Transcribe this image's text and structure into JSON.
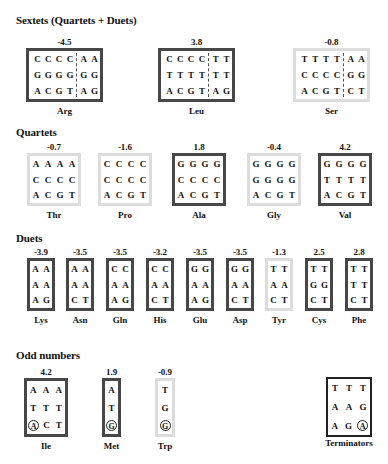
{
  "sections": {
    "sextets": {
      "title": "Sextets (Quartets + Duets)",
      "items": [
        {
          "name": "Arg",
          "value": "-4.5",
          "style": "dark",
          "rows": [
            [
              "C",
              "C",
              "C",
              "C",
              "A",
              "A"
            ],
            [
              "G",
              "G",
              "G",
              "G",
              "G",
              "G"
            ],
            [
              "A",
              "C",
              "G",
              "T",
              "A",
              "G"
            ]
          ]
        },
        {
          "name": "Leu",
          "value": "3.8",
          "style": "dark",
          "rows": [
            [
              "C",
              "C",
              "C",
              "C",
              "T",
              "T"
            ],
            [
              "T",
              "T",
              "T",
              "T",
              "T",
              "T"
            ],
            [
              "A",
              "C",
              "G",
              "T",
              "A",
              "G"
            ]
          ]
        },
        {
          "name": "Ser",
          "value": "-0.8",
          "style": "light",
          "rows": [
            [
              "T",
              "T",
              "T",
              "T",
              "A",
              "A"
            ],
            [
              "C",
              "C",
              "C",
              "C",
              "G",
              "G"
            ],
            [
              "A",
              "C",
              "G",
              "T",
              "C",
              "T"
            ]
          ]
        }
      ]
    },
    "quartets": {
      "title": "Quartets",
      "items": [
        {
          "name": "Thr",
          "value": "-0.7",
          "style": "light",
          "rows": [
            [
              "A",
              "A",
              "A",
              "A"
            ],
            [
              "C",
              "C",
              "C",
              "C"
            ],
            [
              "A",
              "C",
              "G",
              "T"
            ]
          ]
        },
        {
          "name": "Pro",
          "value": "-1.6",
          "style": "light",
          "rows": [
            [
              "C",
              "C",
              "C",
              "C"
            ],
            [
              "C",
              "C",
              "C",
              "C"
            ],
            [
              "A",
              "C",
              "G",
              "T"
            ]
          ]
        },
        {
          "name": "Ala",
          "value": "1.8",
          "style": "dark",
          "rows": [
            [
              "G",
              "G",
              "G",
              "G"
            ],
            [
              "C",
              "C",
              "C",
              "C"
            ],
            [
              "A",
              "C",
              "G",
              "T"
            ]
          ]
        },
        {
          "name": "Gly",
          "value": "-0.4",
          "style": "light",
          "rows": [
            [
              "G",
              "G",
              "G",
              "G"
            ],
            [
              "G",
              "G",
              "G",
              "G"
            ],
            [
              "A",
              "C",
              "G",
              "T"
            ]
          ]
        },
        {
          "name": "Val",
          "value": "4.2",
          "style": "dark",
          "rows": [
            [
              "G",
              "G",
              "G",
              "G"
            ],
            [
              "T",
              "T",
              "T",
              "T"
            ],
            [
              "A",
              "C",
              "G",
              "T"
            ]
          ]
        }
      ]
    },
    "duets": {
      "title": "Duets",
      "items": [
        {
          "name": "Lys",
          "value": "-3.9",
          "style": "dark",
          "rows": [
            [
              "A",
              "A"
            ],
            [
              "A",
              "A"
            ],
            [
              "A",
              "G"
            ]
          ]
        },
        {
          "name": "Asn",
          "value": "-3.5",
          "style": "dark",
          "rows": [
            [
              "A",
              "A"
            ],
            [
              "A",
              "A"
            ],
            [
              "C",
              "T"
            ]
          ]
        },
        {
          "name": "Gln",
          "value": "-3.5",
          "style": "dark",
          "rows": [
            [
              "C",
              "C"
            ],
            [
              "A",
              "A"
            ],
            [
              "A",
              "G"
            ]
          ]
        },
        {
          "name": "His",
          "value": "-3.2",
          "style": "dark",
          "rows": [
            [
              "C",
              "C"
            ],
            [
              "A",
              "A"
            ],
            [
              "C",
              "T"
            ]
          ]
        },
        {
          "name": "Glu",
          "value": "-3.5",
          "style": "dark",
          "rows": [
            [
              "G",
              "G"
            ],
            [
              "A",
              "A"
            ],
            [
              "A",
              "G"
            ]
          ]
        },
        {
          "name": "Asp",
          "value": "-3.5",
          "style": "dark",
          "rows": [
            [
              "G",
              "G"
            ],
            [
              "A",
              "A"
            ],
            [
              "C",
              "T"
            ]
          ]
        },
        {
          "name": "Tyr",
          "value": "-1.3",
          "style": "light",
          "rows": [
            [
              "T",
              "T"
            ],
            [
              "A",
              "A"
            ],
            [
              "C",
              "T"
            ]
          ]
        },
        {
          "name": "Cys",
          "value": "2.5",
          "style": "dark",
          "rows": [
            [
              "T",
              "T"
            ],
            [
              "G",
              "G"
            ],
            [
              "C",
              "T"
            ]
          ]
        },
        {
          "name": "Phe",
          "value": "2.8",
          "style": "dark",
          "rows": [
            [
              "T",
              "T"
            ],
            [
              "T",
              "T"
            ],
            [
              "C",
              "T"
            ]
          ]
        }
      ]
    },
    "odd": {
      "title": "Odd numbers",
      "items": [
        {
          "name": "Ile",
          "value": "4.2",
          "style": "dark",
          "rows": [
            [
              "A",
              "A",
              "A"
            ],
            [
              "T",
              "T",
              "T"
            ],
            [
              "A*",
              "C",
              "T"
            ]
          ]
        },
        {
          "name": "Met",
          "value": "1.9",
          "style": "dark",
          "rows": [
            [
              "A"
            ],
            [
              "T"
            ],
            [
              "G*"
            ]
          ]
        },
        {
          "name": "Trp",
          "value": "-0.9",
          "style": "light",
          "rows": [
            [
              "T"
            ],
            [
              "G"
            ],
            [
              "G*"
            ]
          ]
        }
      ]
    },
    "terminators": {
      "name": "Terminators",
      "style": "term",
      "rows": [
        [
          "T",
          "T",
          "T"
        ],
        [
          "A",
          "A",
          "G"
        ],
        [
          "A",
          "G",
          "A*"
        ]
      ]
    }
  },
  "legend_notes": {
    "circled_marker": "*",
    "dark_border_color": "#474747",
    "light_border_color": "#dcdcdc"
  }
}
